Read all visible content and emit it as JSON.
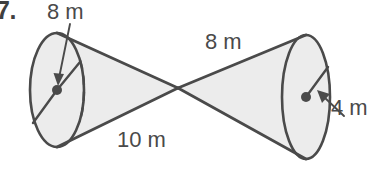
{
  "figure": {
    "problem_number": "7.",
    "labels": {
      "left_radius": "8 m",
      "right_slant": "8 m",
      "left_slant": "10 m",
      "right_radius": "4 m"
    },
    "colors": {
      "stroke": "#4a4a4a",
      "fill": "#ececec",
      "background": "#ffffff",
      "text": "#4a4a4a",
      "dot": "#4a4a4a"
    },
    "left_cone": {
      "base_center": {
        "x": 57,
        "y": 90
      },
      "base_rx": 27,
      "base_ry": 57,
      "apex": {
        "x": 178,
        "y": 88
      },
      "radius_label": "8 m",
      "slant_label": "10 m"
    },
    "right_cone": {
      "base_center": {
        "x": 306,
        "y": 97
      },
      "base_rx": 24,
      "base_ry": 62,
      "apex": {
        "x": 178,
        "y": 88
      },
      "radius_label": "4 m",
      "slant_label": "8 m"
    }
  }
}
